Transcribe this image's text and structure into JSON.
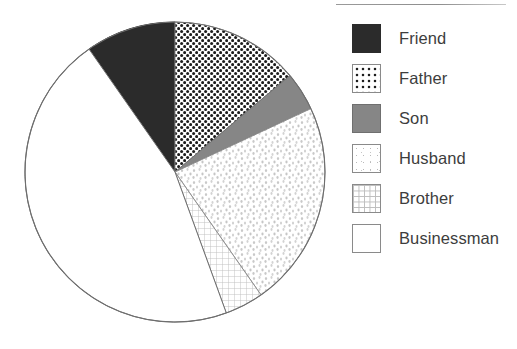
{
  "chart_data": {
    "type": "pie",
    "title": "",
    "subtitle": "",
    "xlabel": "",
    "ylabel": "",
    "grid": false,
    "legend_position": "right",
    "start_angle_deg": 325,
    "direction": "clockwise",
    "categories": [
      "Friend",
      "Father",
      "Son",
      "Husband",
      "Brother",
      "Businessman"
    ],
    "values": [
      9.7,
      13.9,
      4.2,
      22.2,
      4.2,
      45.8
    ],
    "units": "percent",
    "slices": [
      {
        "label": "Friend",
        "value": 9.7,
        "start_deg": 325,
        "end_deg": 360,
        "sweep_deg": 35,
        "fill": "solid-dark",
        "color": "#2b2b2b"
      },
      {
        "label": "Father",
        "value": 13.9,
        "start_deg": 0,
        "end_deg": 50,
        "sweep_deg": 50,
        "fill": "black-dots",
        "color": "#1d1d1d"
      },
      {
        "label": "Son",
        "value": 4.2,
        "start_deg": 50,
        "end_deg": 65,
        "sweep_deg": 15,
        "fill": "solid-gray",
        "color": "#868686"
      },
      {
        "label": "Husband",
        "value": 22.2,
        "start_deg": 65,
        "end_deg": 145,
        "sweep_deg": 80,
        "fill": "light-speckle",
        "color": "#c2c2c2"
      },
      {
        "label": "Brother",
        "value": 4.2,
        "start_deg": 145,
        "end_deg": 160,
        "sweep_deg": 15,
        "fill": "fine-grid",
        "color": "#bdbdbd"
      },
      {
        "label": "Businessman",
        "value": 45.8,
        "start_deg": 160,
        "end_deg": 325,
        "sweep_deg": 165,
        "fill": "plain-white",
        "color": "#ffffff"
      }
    ],
    "geometry": {
      "center_x": 175,
      "center_y": 172,
      "radius": 150,
      "outline_color": "#6e6e6e"
    }
  },
  "legend": {
    "items": [
      {
        "label": "Friend",
        "swatch": "solid-dark-swatch",
        "swatch_class": "sw-solid-dark"
      },
      {
        "label": "Father",
        "swatch": "black-dots-swatch",
        "swatch_class": "sw-dots"
      },
      {
        "label": "Son",
        "swatch": "solid-gray-swatch",
        "swatch_class": "sw-solid-gray"
      },
      {
        "label": "Husband",
        "swatch": "light-speckle-swatch",
        "swatch_class": "sw-speckle"
      },
      {
        "label": "Brother",
        "swatch": "fine-grid-swatch",
        "swatch_class": "sw-grid"
      },
      {
        "label": "Businessman",
        "swatch": "plain-white-swatch",
        "swatch_class": "sw-plain"
      }
    ]
  },
  "colors": {
    "text": "#3d3d3d",
    "outline": "#6e6e6e",
    "rule": "#8e8e8e",
    "background": "#ffffff"
  }
}
